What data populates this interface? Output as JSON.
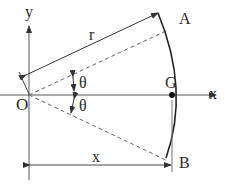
{
  "diagram": {
    "type": "geometry",
    "labels": {
      "origin": "O",
      "x_axis": "x",
      "y_axis": "y",
      "radius": "r",
      "point_a": "A",
      "point_b": "B",
      "centroid": "G",
      "angle_upper": "θ",
      "angle_lower": "θ",
      "distance": "x"
    },
    "colors": {
      "line": "#333333",
      "axis": "#555555",
      "dashed": "#666666",
      "arc": "#222222",
      "text": "#2a2a2a"
    }
  }
}
